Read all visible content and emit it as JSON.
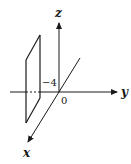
{
  "diagram": {
    "type": "3d-coordinate-axes-with-plane",
    "axes": {
      "z": {
        "label": "z"
      },
      "y": {
        "label": "y"
      },
      "x": {
        "label": "x"
      }
    },
    "origin_label": "0",
    "plane": {
      "description": "plane y = -4 parallel to xz-plane",
      "intercept_label": "−4"
    },
    "colors": {
      "stroke": "#1a1a1a",
      "background": "#ffffff"
    }
  }
}
